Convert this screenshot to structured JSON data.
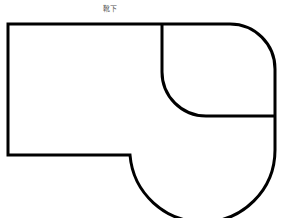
{
  "diagram": {
    "title": "靴下",
    "stroke_color": "#000000",
    "background": "#ffffff"
  }
}
